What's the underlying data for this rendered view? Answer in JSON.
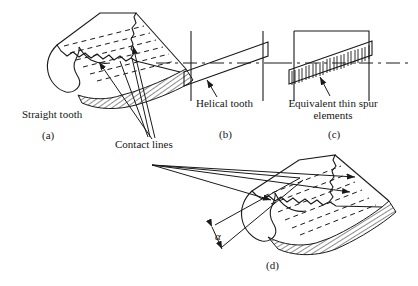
{
  "figure": {
    "type": "engineering-line-diagram",
    "background_color": "#ffffff",
    "line_color": "#1a1a1a",
    "hatch_color": "#333333",
    "panels": [
      {
        "id": "a",
        "caption": "(a)",
        "label": "Straight tooth",
        "description": "Three-dimensional spur gear tooth with horizontal dashed contact lines across the tooth face and hatched root fillet surface"
      },
      {
        "id": "b",
        "caption": "(b)",
        "label": "Helical tooth",
        "description": "Plan view of helical tooth shown as a slanted parallelogram band between two vertical face boundary lines crossed by a horizontal dash-dot pitch line"
      },
      {
        "id": "c",
        "caption": "(c)",
        "label": "Equivalent thin spur elements",
        "description": "Same helical band subdivided into many narrow vertical strips representing equivalent thin spur gear elements, enclosed by a rectangular outline"
      },
      {
        "id": "d",
        "caption": "(d)",
        "label": "",
        "angle_symbol": "α",
        "description": "Three-dimensional helical gear tooth with inclined dashed contact lines, hatched root surface, and helix angle alpha dimensioned at the lower left"
      }
    ],
    "shared_annotations": [
      {
        "name": "contact-lines",
        "text": "Contact lines",
        "description": "Leader lines fan out from this label to the dashed contact lines on panels (a) and (d)"
      }
    ],
    "symbols": {
      "alpha": "α"
    }
  }
}
